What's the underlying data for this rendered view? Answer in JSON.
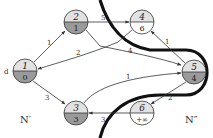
{
  "diagram": {
    "type": "graph-cut",
    "source_label": "d",
    "region_labels": {
      "left": "N′",
      "right": "N″"
    },
    "colors": {
      "node_top_fill": "#e2e2e2",
      "node_bottom_fill_visited": "#9a9a9a",
      "node_bottom_fill_unvisited": "#ffffff",
      "stroke": "#333333",
      "cut": "#111111"
    },
    "nodes": [
      {
        "id": "1",
        "label": "1",
        "value": "0",
        "in_set": true,
        "cx": 25,
        "cy": 71
      },
      {
        "id": "2",
        "label": "2",
        "value": "1",
        "in_set": true,
        "cx": 76,
        "cy": 22
      },
      {
        "id": "3",
        "label": "3",
        "value": "3",
        "in_set": true,
        "cx": 76,
        "cy": 113
      },
      {
        "id": "4",
        "label": "4",
        "value": "6",
        "in_set": false,
        "cx": 142,
        "cy": 22
      },
      {
        "id": "5",
        "label": "5",
        "value": "4",
        "in_set": true,
        "cx": 194,
        "cy": 72
      },
      {
        "id": "6",
        "label": "6",
        "value": "+∞",
        "in_set": false,
        "cx": 142,
        "cy": 113
      }
    ],
    "edges": [
      {
        "from": "1",
        "to": "2",
        "weight": "1"
      },
      {
        "from": "2",
        "to": "4",
        "weight": "5"
      },
      {
        "from": "2",
        "to": "5",
        "weight": "4"
      },
      {
        "from": "4",
        "to": "1",
        "weight": "2"
      },
      {
        "from": "5",
        "to": "4",
        "weight": "1"
      },
      {
        "from": "1",
        "to": "3",
        "weight": "3"
      },
      {
        "from": "3",
        "to": "5",
        "weight": "1"
      },
      {
        "from": "5",
        "to": "6",
        "weight": "2"
      },
      {
        "from": "6",
        "to": "3",
        "weight": "3"
      }
    ]
  }
}
